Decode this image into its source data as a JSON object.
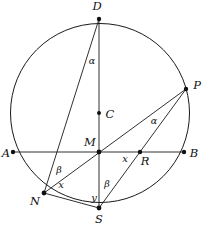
{
  "figure": {
    "type": "geometry-diagram",
    "canvas": {
      "width": 208,
      "height": 227
    },
    "colors": {
      "stroke": "#1a1a1a",
      "dot": "#111111",
      "background": "#ffffff",
      "label": "#111111"
    },
    "circle": {
      "cx": 100,
      "cy": 113,
      "r": 89.5
    },
    "points": [
      {
        "id": "D",
        "label": "D",
        "x": 99,
        "y": 19,
        "label_x": 97,
        "label_y": 7,
        "dot": true
      },
      {
        "id": "P",
        "label": "P",
        "x": 186,
        "y": 89,
        "label_x": 197,
        "label_y": 86,
        "dot": true
      },
      {
        "id": "C",
        "label": "C",
        "x": 99,
        "y": 113,
        "label_x": 110,
        "label_y": 115,
        "dot": true
      },
      {
        "id": "A",
        "label": "A",
        "x": 13,
        "y": 152,
        "label_x": 6,
        "label_y": 154,
        "dot": true
      },
      {
        "id": "M",
        "label": "M",
        "x": 99,
        "y": 152,
        "label_x": 90,
        "label_y": 143,
        "dot": true
      },
      {
        "id": "R",
        "label": "R",
        "x": 140,
        "y": 152,
        "label_x": 145,
        "label_y": 162,
        "dot": true
      },
      {
        "id": "B",
        "label": "B",
        "x": 184,
        "y": 152,
        "label_x": 194,
        "label_y": 154,
        "dot": true
      },
      {
        "id": "N",
        "label": "N",
        "x": 44,
        "y": 193,
        "label_x": 35,
        "label_y": 202,
        "dot": true
      },
      {
        "id": "S",
        "label": "S",
        "x": 99,
        "y": 208,
        "label_x": 99,
        "label_y": 220,
        "dot": true
      }
    ],
    "segments": [
      {
        "id": "AB",
        "from": "A",
        "to": "B",
        "x1": 13,
        "y1": 152,
        "x2": 184,
        "y2": 152
      },
      {
        "id": "DS",
        "from": "D",
        "to": "S",
        "x1": 99,
        "y1": 19,
        "x2": 99,
        "y2": 208
      },
      {
        "id": "DN",
        "from": "D",
        "to": "N",
        "x1": 99,
        "y1": 19,
        "x2": 44,
        "y2": 193
      },
      {
        "id": "NP",
        "from": "N",
        "to": "P",
        "x1": 44,
        "y1": 193,
        "x2": 186,
        "y2": 89
      },
      {
        "id": "SP",
        "from": "S",
        "to": "P",
        "x1": 99,
        "y1": 208,
        "x2": 186,
        "y2": 89
      },
      {
        "id": "NS",
        "from": "N",
        "to": "S",
        "x1": 44,
        "y1": 193,
        "x2": 99,
        "y2": 208
      }
    ],
    "angle_labels": [
      {
        "id": "alpha-at-D",
        "text": "α",
        "x": 92,
        "y": 61
      },
      {
        "id": "alpha-at-P",
        "text": "α",
        "x": 154,
        "y": 121
      },
      {
        "id": "beta-at-N",
        "text": "β",
        "x": 59,
        "y": 170
      },
      {
        "id": "beta-at-S",
        "text": "β",
        "x": 107,
        "y": 184
      }
    ],
    "segment_labels": [
      {
        "id": "x-at-MR",
        "text": "x",
        "x": 125,
        "y": 159
      },
      {
        "id": "x-at-N",
        "text": "x",
        "x": 61,
        "y": 185
      },
      {
        "id": "y-at-S",
        "text": "y",
        "x": 94,
        "y": 198
      }
    ]
  }
}
